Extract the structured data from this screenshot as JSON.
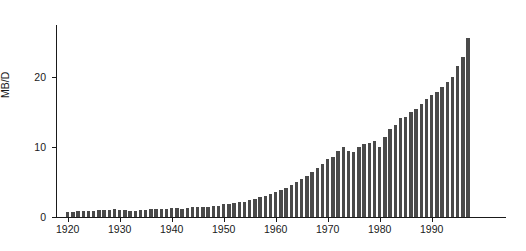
{
  "chart_data": {
    "type": "bar",
    "title": "",
    "subtitle": "",
    "xlabel": "",
    "ylabel": "MB/D",
    "xlim": [
      1919,
      1998
    ],
    "ylim": [
      0,
      27
    ],
    "grid": false,
    "legend": null,
    "bar_color": "#4a4a4a",
    "axis_color": "#1a1a1a",
    "background_color": "#ffffff",
    "y_ticks": [
      0,
      10,
      20
    ],
    "y_tick_labels": [
      "0",
      "10",
      "20"
    ],
    "x_ticks": [
      1920,
      1930,
      1940,
      1950,
      1960,
      1970,
      1980,
      1990
    ],
    "x_tick_labels": [
      "1920",
      "1930",
      "1940",
      "1950",
      "1960",
      "1970",
      "1980",
      "1990"
    ],
    "categories": [
      1920,
      1921,
      1922,
      1923,
      1924,
      1925,
      1926,
      1927,
      1928,
      1929,
      1930,
      1931,
      1932,
      1933,
      1934,
      1935,
      1936,
      1937,
      1938,
      1939,
      1940,
      1941,
      1942,
      1943,
      1944,
      1945,
      1946,
      1947,
      1948,
      1949,
      1950,
      1951,
      1952,
      1953,
      1954,
      1955,
      1956,
      1957,
      1958,
      1959,
      1960,
      1961,
      1962,
      1963,
      1964,
      1965,
      1966,
      1967,
      1968,
      1969,
      1970,
      1971,
      1972,
      1973,
      1974,
      1975,
      1976,
      1977,
      1978,
      1979,
      1980,
      1981,
      1982,
      1983,
      1984,
      1985,
      1986,
      1987,
      1988,
      1989,
      1990,
      1991,
      1992,
      1993,
      1994,
      1995,
      1996,
      1997
    ],
    "values": [
      0.7,
      0.7,
      0.8,
      0.9,
      0.9,
      0.9,
      1.0,
      1.0,
      1.0,
      1.1,
      1.0,
      1.0,
      0.9,
      0.9,
      1.0,
      1.0,
      1.1,
      1.2,
      1.2,
      1.2,
      1.3,
      1.3,
      1.2,
      1.3,
      1.4,
      1.4,
      1.4,
      1.5,
      1.6,
      1.6,
      1.8,
      1.9,
      2.0,
      2.1,
      2.2,
      2.4,
      2.6,
      2.8,
      3.0,
      3.3,
      3.6,
      3.9,
      4.2,
      4.6,
      5.0,
      5.4,
      5.9,
      6.4,
      7.0,
      7.6,
      8.3,
      8.6,
      9.4,
      10.0,
      9.5,
      9.3,
      10.0,
      10.4,
      10.6,
      10.8,
      10.0,
      11.4,
      12.6,
      13.2,
      14.1,
      14.3,
      15.0,
      15.5,
      16.2,
      16.9,
      17.4,
      17.9,
      18.6,
      19.3,
      20.0,
      21.6,
      22.9,
      25.6
    ]
  }
}
